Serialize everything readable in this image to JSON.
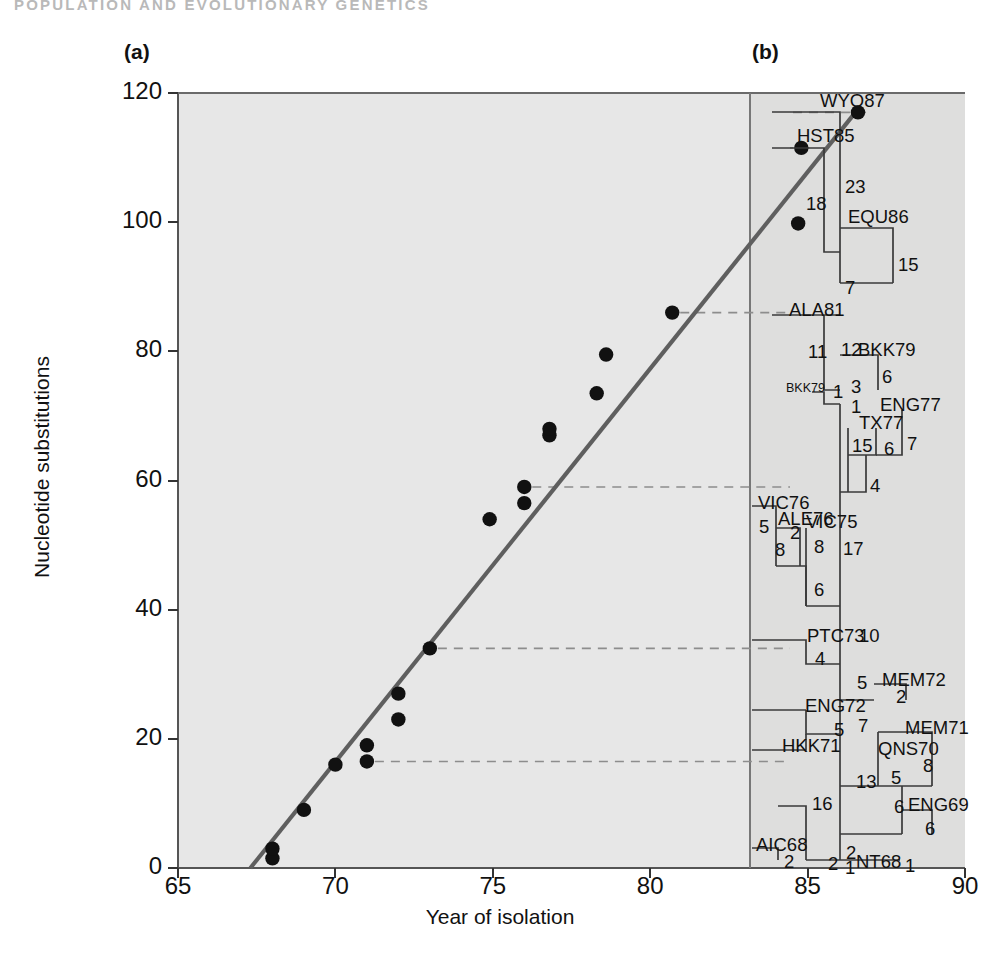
{
  "header": {
    "running_head": "POPULATION AND EVOLUTIONARY GENETICS"
  },
  "figure": {
    "panel_a_label": "(a)",
    "panel_b_label": "(b)"
  },
  "chart_data": {
    "type": "scatter",
    "title": "",
    "xlabel": "Year of isolation",
    "ylabel": "Nucleotide substitutions",
    "xlim": [
      65,
      90
    ],
    "ylim": [
      0,
      120
    ],
    "xticks": [
      "65",
      "70",
      "75",
      "80",
      "85",
      "90"
    ],
    "yticks": [
      "0",
      "20",
      "40",
      "60",
      "80",
      "100",
      "120"
    ],
    "grid": false,
    "legend": "none",
    "points": [
      {
        "x": 68.0,
        "y": 1.5,
        "label": "NT68"
      },
      {
        "x": 68.0,
        "y": 3.0,
        "label": "AIC68"
      },
      {
        "x": 69.0,
        "y": 9.0,
        "label": "ENG69"
      },
      {
        "x": 70.0,
        "y": 16.0,
        "label": "QNS70"
      },
      {
        "x": 71.0,
        "y": 19.0,
        "label": "MEM71"
      },
      {
        "x": 71.0,
        "y": 16.5,
        "label": "HKK71"
      },
      {
        "x": 72.0,
        "y": 23.0,
        "label": "ENG72"
      },
      {
        "x": 72.0,
        "y": 27.0,
        "label": "MEM72"
      },
      {
        "x": 73.0,
        "y": 34.0,
        "label": "PTC73"
      },
      {
        "x": 74.9,
        "y": 54.0,
        "label": "VIC75"
      },
      {
        "x": 76.0,
        "y": 56.5,
        "label": "ALE76"
      },
      {
        "x": 76.0,
        "y": 59.0,
        "label": "VIC76"
      },
      {
        "x": 76.8,
        "y": 67.0,
        "label": "TX77"
      },
      {
        "x": 76.8,
        "y": 68.0,
        "label": "ENG77"
      },
      {
        "x": 78.3,
        "y": 73.5,
        "label": "BKK79"
      },
      {
        "x": 78.6,
        "y": 79.5,
        "label": "BKK79b"
      },
      {
        "x": 80.7,
        "y": 86.0,
        "label": "ALA81"
      },
      {
        "x": 84.7,
        "y": 99.8,
        "label": "EQU86"
      },
      {
        "x": 84.8,
        "y": 111.5,
        "label": "HST85"
      },
      {
        "x": 86.6,
        "y": 117.0,
        "label": "WYO87"
      }
    ],
    "trendline": {
      "x0": 67.3,
      "y0": 0.0,
      "x1": 86.6,
      "y1": 117.5,
      "color": "#5f5f5f"
    },
    "connector_lines_y": [
      117.0,
      111.5,
      86.0,
      59.0,
      34.0,
      16.5
    ],
    "point_color": "#111111",
    "plot_bg": "#e7e7e7",
    "tree_bg": "#dededd"
  },
  "tree": {
    "caption": "Phylogenetic tree of influenza isolates with branch lengths in nucleotide substitutions",
    "taxa": [
      "WYO87",
      "HST85",
      "EQU86",
      "ALA81",
      "BKK79",
      "BKK79",
      "ENG77",
      "TX77",
      "VIC76",
      "ALE76",
      "VIC75",
      "PTC73",
      "MEM72",
      "ENG72",
      "HKK71",
      "MEM71",
      "QNS70",
      "ENG69",
      "AIC68",
      "NT68"
    ],
    "branch_values": [
      "23",
      "18",
      "15",
      "7",
      "11",
      "12",
      "6",
      "3",
      "1",
      "1",
      "15",
      "6",
      "7",
      "4",
      "5",
      "2",
      "8",
      "8",
      "17",
      "6",
      "10",
      "4",
      "5",
      "2",
      "5",
      "7",
      "13",
      "8",
      "5",
      "6",
      "16",
      "6",
      "2",
      "2",
      "1",
      "2",
      "1"
    ],
    "nodes": [
      {
        "name": "taxon-wyo87",
        "text": "WYO87",
        "x": 820,
        "y": 92,
        "type": "taxon"
      },
      {
        "name": "taxon-hst85",
        "text": "HST85",
        "x": 797,
        "y": 127,
        "type": "taxon"
      },
      {
        "name": "branch-23",
        "text": "23",
        "x": 845,
        "y": 178,
        "type": "branch"
      },
      {
        "name": "branch-18",
        "text": "18",
        "x": 806,
        "y": 195,
        "type": "branch"
      },
      {
        "name": "taxon-equ86",
        "text": "EQU86",
        "x": 848,
        "y": 208,
        "type": "taxon"
      },
      {
        "name": "branch-15a",
        "text": "15",
        "x": 898,
        "y": 256,
        "type": "branch"
      },
      {
        "name": "branch-7a",
        "text": "7",
        "x": 845,
        "y": 279,
        "type": "branch"
      },
      {
        "name": "taxon-ala81",
        "text": "ALA81",
        "x": 789,
        "y": 301,
        "type": "taxon"
      },
      {
        "name": "branch-11",
        "text": "11",
        "x": 808,
        "y": 343,
        "type": "branch"
      },
      {
        "name": "branch-12",
        "text": "12",
        "x": 841,
        "y": 341,
        "type": "branch"
      },
      {
        "name": "taxon-bkk79a",
        "text": "BKK79",
        "x": 858,
        "y": 341,
        "type": "taxon"
      },
      {
        "name": "branch-6a",
        "text": "6",
        "x": 882,
        "y": 368,
        "type": "branch"
      },
      {
        "name": "taxon-bkk79b",
        "text": "BKK79",
        "x": 786,
        "y": 382,
        "type": "taxon"
      },
      {
        "name": "branch-3",
        "text": "3",
        "x": 851,
        "y": 378,
        "type": "branch"
      },
      {
        "name": "branch-1a",
        "text": "1",
        "x": 833,
        "y": 383,
        "type": "branch"
      },
      {
        "name": "branch-1b",
        "text": "1",
        "x": 851,
        "y": 398,
        "type": "branch"
      },
      {
        "name": "taxon-eng77",
        "text": "ENG77",
        "x": 880,
        "y": 396,
        "type": "taxon"
      },
      {
        "name": "taxon-tx77",
        "text": "TX77",
        "x": 859,
        "y": 414,
        "type": "taxon"
      },
      {
        "name": "branch-15b",
        "text": "15",
        "x": 852,
        "y": 437,
        "type": "branch"
      },
      {
        "name": "branch-6b",
        "text": "6",
        "x": 884,
        "y": 440,
        "type": "branch"
      },
      {
        "name": "branch-7b",
        "text": "7",
        "x": 907,
        "y": 435,
        "type": "branch"
      },
      {
        "name": "branch-4a",
        "text": "4",
        "x": 870,
        "y": 477,
        "type": "branch"
      },
      {
        "name": "taxon-vic76",
        "text": "VIC76",
        "x": 758,
        "y": 494,
        "type": "taxon"
      },
      {
        "name": "branch-5a",
        "text": "5",
        "x": 759,
        "y": 518,
        "type": "branch"
      },
      {
        "name": "taxon-ale76",
        "text": "ALE76",
        "x": 778,
        "y": 510,
        "type": "taxon"
      },
      {
        "name": "branch-2a",
        "text": "2",
        "x": 790,
        "y": 524,
        "type": "branch"
      },
      {
        "name": "taxon-vic75",
        "text": "VIC75",
        "x": 806,
        "y": 513,
        "type": "taxon"
      },
      {
        "name": "branch-8a",
        "text": "8",
        "x": 775,
        "y": 541,
        "type": "branch"
      },
      {
        "name": "branch-8b",
        "text": "8",
        "x": 814,
        "y": 538,
        "type": "branch"
      },
      {
        "name": "branch-17",
        "text": "17",
        "x": 843,
        "y": 540,
        "type": "branch"
      },
      {
        "name": "branch-6c",
        "text": "6",
        "x": 814,
        "y": 581,
        "type": "branch"
      },
      {
        "name": "taxon-ptc73",
        "text": "PTC73",
        "x": 807,
        "y": 627,
        "type": "taxon"
      },
      {
        "name": "branch-10",
        "text": "10",
        "x": 859,
        "y": 627,
        "type": "branch"
      },
      {
        "name": "branch-4b",
        "text": "4",
        "x": 815,
        "y": 650,
        "type": "branch"
      },
      {
        "name": "branch-5b",
        "text": "5",
        "x": 857,
        "y": 674,
        "type": "branch"
      },
      {
        "name": "taxon-mem72",
        "text": "MEM72",
        "x": 882,
        "y": 671,
        "type": "taxon"
      },
      {
        "name": "branch-2b",
        "text": "2",
        "x": 896,
        "y": 688,
        "type": "branch"
      },
      {
        "name": "taxon-eng72",
        "text": "ENG72",
        "x": 805,
        "y": 697,
        "type": "taxon"
      },
      {
        "name": "branch-5c",
        "text": "5",
        "x": 834,
        "y": 721,
        "type": "branch"
      },
      {
        "name": "branch-7c",
        "text": "7",
        "x": 858,
        "y": 717,
        "type": "branch"
      },
      {
        "name": "taxon-mem71",
        "text": "MEM71",
        "x": 905,
        "y": 719,
        "type": "taxon"
      },
      {
        "name": "taxon-hkk71",
        "text": "HKK71",
        "x": 782,
        "y": 737,
        "type": "taxon"
      },
      {
        "name": "taxon-qns70",
        "text": "QNS70",
        "x": 878,
        "y": 740,
        "type": "taxon"
      },
      {
        "name": "branch-8c",
        "text": "8",
        "x": 923,
        "y": 757,
        "type": "branch"
      },
      {
        "name": "branch-13",
        "text": "13",
        "x": 856,
        "y": 773,
        "type": "branch"
      },
      {
        "name": "branch-5d",
        "text": "5",
        "x": 891,
        "y": 769,
        "type": "branch"
      },
      {
        "name": "branch-16",
        "text": "16",
        "x": 812,
        "y": 795,
        "type": "branch"
      },
      {
        "name": "branch-6d",
        "text": "6",
        "x": 894,
        "y": 798,
        "type": "branch"
      },
      {
        "name": "taxon-eng69",
        "text": "ENG69",
        "x": 908,
        "y": 796,
        "type": "taxon"
      },
      {
        "name": "branch-6e",
        "text": "6",
        "x": 925,
        "y": 820,
        "type": "branch"
      },
      {
        "name": "taxon-aic68",
        "text": "AIC68",
        "x": 756,
        "y": 836,
        "type": "taxon"
      },
      {
        "name": "branch-2c",
        "text": "2",
        "x": 784,
        "y": 853,
        "type": "branch"
      },
      {
        "name": "branch-2d",
        "text": "2",
        "x": 846,
        "y": 844,
        "type": "branch"
      },
      {
        "name": "branch-2e",
        "text": "2",
        "x": 828,
        "y": 855,
        "type": "branch"
      },
      {
        "name": "branch-1c",
        "text": "1",
        "x": 845,
        "y": 859,
        "type": "branch"
      },
      {
        "name": "taxon-nt68",
        "text": "NT68",
        "x": 856,
        "y": 853,
        "type": "taxon"
      },
      {
        "name": "branch-1d",
        "text": "1",
        "x": 905,
        "y": 857,
        "type": "branch"
      }
    ]
  }
}
